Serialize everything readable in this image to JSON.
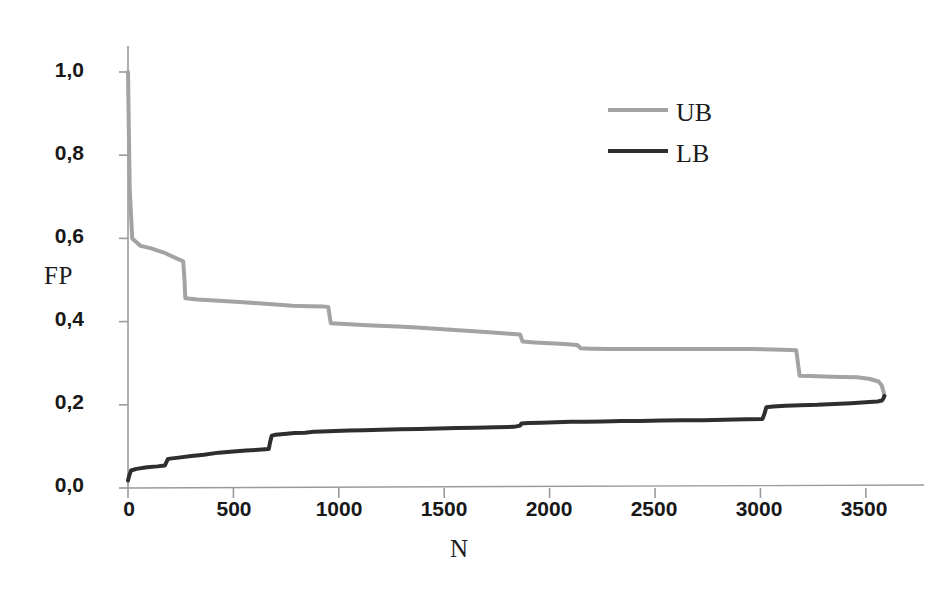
{
  "chart_data": {
    "type": "line",
    "title": "",
    "subtitle": "",
    "xlabel": "N",
    "ylabel": "FP",
    "xlim": [
      0,
      3700
    ],
    "ylim": [
      0.0,
      1.0
    ],
    "grid": false,
    "decimal_separator": ",",
    "legend_position": "top-right",
    "xticks": [
      0,
      500,
      1000,
      1500,
      2000,
      2500,
      3000,
      3500
    ],
    "xticklabels": [
      "0",
      "500",
      "1000",
      "1500",
      "2000",
      "2500",
      "3000",
      "3500"
    ],
    "yticks": [
      0.0,
      0.2,
      0.4,
      0.6,
      0.8,
      1.0
    ],
    "yticklabels": [
      "0,0",
      "0,2",
      "0,4",
      "0,6",
      "0,8",
      "1,0"
    ],
    "series": [
      {
        "name": "UB",
        "label": "UB",
        "color": "#a3a3a3",
        "linewidth": 4,
        "x": [
          0,
          8,
          20,
          60,
          110,
          170,
          230,
          262,
          268,
          272,
          330,
          430,
          530,
          620,
          700,
          780,
          860,
          930,
          950,
          956,
          962,
          1030,
          1110,
          1190,
          1280,
          1370,
          1460,
          1550,
          1640,
          1730,
          1810,
          1860,
          1866,
          1872,
          1930,
          2000,
          2070,
          2130,
          2140,
          2146,
          2200,
          2280,
          2370,
          2460,
          2560,
          2660,
          2760,
          2860,
          2960,
          3060,
          3140,
          3170,
          3178,
          3186,
          3240,
          3300,
          3380,
          3460,
          3520,
          3560,
          3575,
          3582,
          3588
        ],
        "y": [
          1.0,
          0.72,
          0.6,
          0.582,
          0.576,
          0.566,
          0.552,
          0.545,
          0.5,
          0.456,
          0.453,
          0.45,
          0.447,
          0.444,
          0.441,
          0.438,
          0.437,
          0.436,
          0.435,
          0.415,
          0.396,
          0.394,
          0.392,
          0.39,
          0.388,
          0.386,
          0.383,
          0.38,
          0.377,
          0.374,
          0.371,
          0.369,
          0.36,
          0.352,
          0.35,
          0.348,
          0.346,
          0.344,
          0.34,
          0.336,
          0.335,
          0.334,
          0.334,
          0.334,
          0.334,
          0.334,
          0.334,
          0.334,
          0.334,
          0.333,
          0.332,
          0.331,
          0.3,
          0.27,
          0.269,
          0.268,
          0.267,
          0.266,
          0.262,
          0.256,
          0.247,
          0.235,
          0.222
        ]
      },
      {
        "name": "LB",
        "label": "LB",
        "color": "#2e2e2e",
        "linewidth": 4,
        "x": [
          0,
          6,
          14,
          40,
          90,
          140,
          175,
          182,
          190,
          240,
          300,
          360,
          430,
          500,
          560,
          620,
          668,
          674,
          682,
          700,
          740,
          790,
          840,
          880,
          920,
          980,
          1050,
          1120,
          1200,
          1290,
          1380,
          1470,
          1560,
          1650,
          1740,
          1830,
          1860,
          1866,
          1900,
          1960,
          2030,
          2100,
          2170,
          2250,
          2340,
          2430,
          2530,
          2630,
          2730,
          2830,
          2930,
          3010,
          3020,
          3028,
          3060,
          3120,
          3190,
          3270,
          3350,
          3430,
          3500,
          3555,
          3575,
          3582,
          3588
        ],
        "y": [
          0.018,
          0.03,
          0.042,
          0.046,
          0.05,
          0.052,
          0.054,
          0.062,
          0.07,
          0.073,
          0.077,
          0.08,
          0.085,
          0.088,
          0.09,
          0.092,
          0.094,
          0.11,
          0.126,
          0.128,
          0.13,
          0.132,
          0.133,
          0.135,
          0.136,
          0.137,
          0.138,
          0.139,
          0.14,
          0.141,
          0.142,
          0.143,
          0.144,
          0.145,
          0.146,
          0.147,
          0.15,
          0.155,
          0.156,
          0.157,
          0.158,
          0.159,
          0.159,
          0.16,
          0.161,
          0.161,
          0.162,
          0.163,
          0.163,
          0.164,
          0.165,
          0.166,
          0.18,
          0.194,
          0.196,
          0.198,
          0.199,
          0.2,
          0.202,
          0.204,
          0.206,
          0.208,
          0.21,
          0.214,
          0.221
        ]
      }
    ],
    "annotations": []
  },
  "axes": {
    "ylabel": "FP",
    "xlabel": "N",
    "ytick_labels": [
      "1,0",
      "0,8",
      "0,6",
      "0,4",
      "0,2",
      "0,0"
    ],
    "xtick_labels": [
      "0",
      "500",
      "1000",
      "1500",
      "2000",
      "2500",
      "3000",
      "3500"
    ]
  },
  "legend": {
    "entries": [
      {
        "label": "UB",
        "color": "#a3a3a3"
      },
      {
        "label": "LB",
        "color": "#2e2e2e"
      }
    ]
  },
  "colors": {
    "background": "#ffffff",
    "axis": "#9a9a9a",
    "ub_line": "#a3a3a3",
    "lb_line": "#2e2e2e",
    "text": "#1c1c1c"
  }
}
